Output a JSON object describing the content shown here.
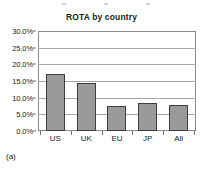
{
  "figure": {
    "caption": "(a)"
  },
  "chart_data": {
    "type": "bar",
    "title": "ROTA by country",
    "xlabel": "",
    "ylabel": "",
    "categories": [
      "US",
      "UK",
      "EU",
      "JP",
      "All"
    ],
    "values": [
      17.0,
      14.3,
      7.4,
      8.4,
      7.9
    ],
    "value_labels": [
      "17.0%",
      "14.3%",
      "7.4%",
      "8.4%",
      "7.9%"
    ],
    "ylim": [
      0,
      30
    ],
    "ytick_values": [
      30.0,
      25.0,
      20.0,
      15.0,
      10.0,
      5.0,
      0.0
    ],
    "ytick_labels": [
      "30.0%",
      "25.0%",
      "20.0%",
      "15.0%",
      "10.0%",
      "5.0%",
      "0.0%"
    ],
    "grid": true,
    "legend": false,
    "legend_position": "none",
    "bar_color": "#9a9a9a",
    "bar_border_color": "#3d3d3d",
    "gridline_color": "#a8a8a8",
    "plot_border_color": "#8c8c8c",
    "background_color": "#ffffff"
  }
}
